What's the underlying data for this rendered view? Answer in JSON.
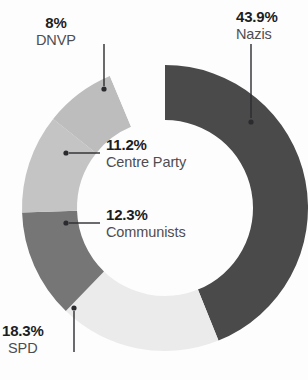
{
  "chart_data": {
    "type": "pie",
    "variant": "donut",
    "title": "",
    "subtitle": "",
    "xlabel": "",
    "ylabel": "",
    "grid": false,
    "legend_position": "none",
    "label_format": "percent",
    "start_angle_deg": 0,
    "direction": "clockwise",
    "outer_radius_px": 143,
    "inner_radius_px": 88,
    "center_px": [
      165,
      208
    ],
    "categories": [
      "Nazis",
      "SPD",
      "Communists",
      "Centre Party",
      "DNVP"
    ],
    "values": [
      43.9,
      18.3,
      12.3,
      11.2,
      8.0
    ],
    "value_labels": [
      "43.9%",
      "18.3%",
      "12.3%",
      "11.2%",
      "8%"
    ],
    "colors": [
      "#4a4a4a",
      "#ebebeb",
      "#767676",
      "#c4c4c4",
      "#bdbdbd"
    ],
    "slices": [
      {
        "name": "Nazis",
        "value": 43.9,
        "value_label": "43.9%",
        "color": "#4a4a4a"
      },
      {
        "name": "SPD",
        "value": 18.3,
        "value_label": "18.3%",
        "color": "#ebebeb"
      },
      {
        "name": "Communists",
        "value": 12.3,
        "value_label": "12.3%",
        "color": "#767676"
      },
      {
        "name": "Centre Party",
        "value": 11.2,
        "value_label": "11.2%",
        "color": "#c4c4c4"
      },
      {
        "name": "DNVP",
        "value": 8.0,
        "value_label": "8%",
        "color": "#bdbdbd"
      }
    ]
  },
  "labels": {
    "dnvp": {
      "pct": "8%",
      "name": "DNVP"
    },
    "nazis": {
      "pct": "43.9%",
      "name": "Nazis"
    },
    "centre": {
      "pct": "11.2%",
      "name": "Centre Party"
    },
    "communists": {
      "pct": "12.3%",
      "name": "Communists"
    },
    "spd": {
      "pct": "18.3%",
      "name": "SPD"
    }
  },
  "style": {
    "background": "#fdfdfd",
    "pct_color": "#1d1d1f",
    "name_color": "#4d4d52",
    "leader_color": "#2b2b2f"
  }
}
